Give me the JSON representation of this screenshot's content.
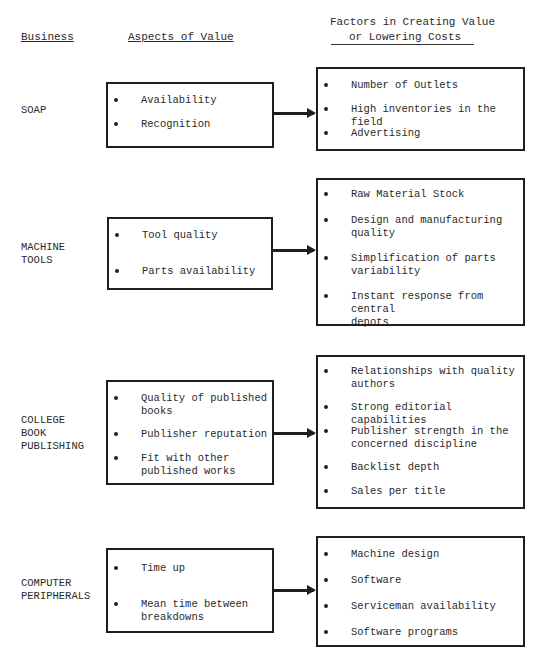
{
  "headers": {
    "business": "Business",
    "aspects": "Aspects of Value",
    "factors_line1": "Factors in Creating Value",
    "factors_line2": "or Lowering Costs"
  },
  "rows": [
    {
      "business": "SOAP",
      "aspects": [
        "Availability",
        "Recognition"
      ],
      "factors": [
        "Number of Outlets",
        "High inventories in the field",
        "Advertising"
      ]
    },
    {
      "business": "MACHINE\nTOOLS",
      "aspects": [
        "Tool quality",
        "Parts availability"
      ],
      "factors": [
        "Raw Material Stock",
        "Design and manufacturing\nquality",
        "Simplification of parts\nvariability",
        "Instant response from central\ndepots"
      ]
    },
    {
      "business": "COLLEGE\nBOOK\nPUBLISHING",
      "aspects": [
        "Quality of published\nbooks",
        "Publisher reputation",
        "Fit with other\npublished works"
      ],
      "factors": [
        "Relationships with quality\nauthors",
        "Strong editorial capabilities",
        "Publisher strength in the\nconcerned discipline",
        "Backlist depth",
        "Sales per title"
      ]
    },
    {
      "business": "COMPUTER\nPERIPHERALS",
      "aspects": [
        "Time up",
        "Mean time between\nbreakdowns"
      ],
      "factors": [
        "Machine design",
        "Software",
        "Serviceman availability",
        "Software programs"
      ]
    }
  ]
}
